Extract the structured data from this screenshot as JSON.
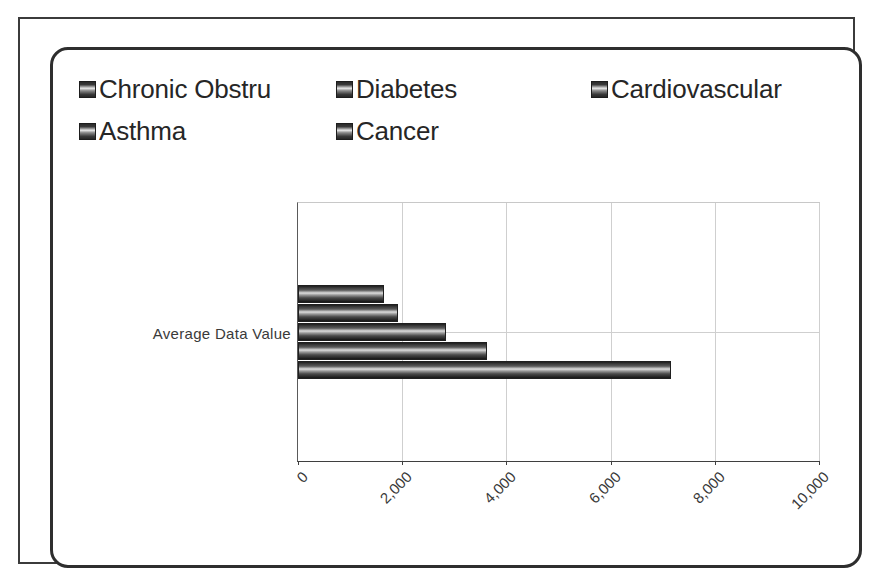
{
  "chart_panel": {
    "title": ""
  },
  "legend": {
    "position": "top",
    "items": [
      {
        "label": "Chronic Obstru",
        "swatch": "gradient-bar-swatch"
      },
      {
        "label": "Diabetes",
        "swatch": "gradient-bar-swatch"
      },
      {
        "label": "Cardiovascular",
        "swatch": "gradient-bar-swatch"
      },
      {
        "label": "Asthma",
        "swatch": "gradient-bar-swatch"
      },
      {
        "label": "Cancer",
        "swatch": "gradient-bar-swatch"
      }
    ]
  },
  "axes": {
    "category_label": "Average Data Value",
    "x_ticks": [
      "0",
      "2,000",
      "4,000",
      "6,000",
      "8,000",
      "10,000"
    ]
  },
  "chart_data": {
    "type": "bar",
    "orientation": "horizontal",
    "title": "",
    "xlabel": "",
    "ylabel": "Average Data Value",
    "categories": [
      "Average Data Value"
    ],
    "series": [
      {
        "name": "Chronic Obstru",
        "values": [
          1650
        ]
      },
      {
        "name": "Diabetes",
        "values": [
          1920
        ]
      },
      {
        "name": "Cardiovascular",
        "values": [
          2850
        ]
      },
      {
        "name": "Asthma",
        "values": [
          3620
        ]
      },
      {
        "name": "Cancer",
        "values": [
          7150
        ]
      }
    ],
    "xlim": [
      0,
      10000
    ],
    "x_ticks": [
      0,
      2000,
      4000,
      6000,
      8000,
      10000
    ],
    "grid": true,
    "legend_position": "top"
  }
}
